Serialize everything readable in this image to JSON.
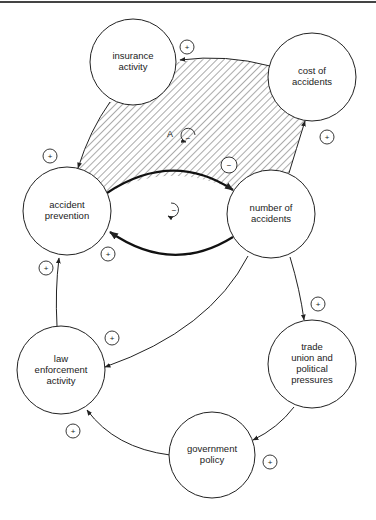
{
  "diagram": {
    "type": "causal-loop",
    "nodes": [
      {
        "id": "insurance",
        "lines": [
          "insurance",
          "activity"
        ]
      },
      {
        "id": "cost",
        "lines": [
          "cost of",
          "accidents"
        ]
      },
      {
        "id": "prevention",
        "lines": [
          "accident",
          "prevention"
        ]
      },
      {
        "id": "number",
        "lines": [
          "number of",
          "accidents"
        ]
      },
      {
        "id": "law",
        "lines": [
          "law",
          "enforcement",
          "activity"
        ]
      },
      {
        "id": "trade",
        "lines": [
          "trade",
          "union and",
          "political",
          "pressures"
        ]
      },
      {
        "id": "government",
        "lines": [
          "government",
          "policy"
        ]
      }
    ],
    "links": [
      {
        "from": "cost",
        "to": "insurance",
        "sign": "+"
      },
      {
        "from": "insurance",
        "to": "prevention",
        "sign": "+"
      },
      {
        "from": "prevention",
        "to": "number",
        "sign": "−"
      },
      {
        "from": "number",
        "to": "prevention",
        "sign": "+"
      },
      {
        "from": "number",
        "to": "cost",
        "sign": "+"
      },
      {
        "from": "law",
        "to": "prevention",
        "sign": "+"
      },
      {
        "from": "number",
        "to": "law",
        "sign": "+"
      },
      {
        "from": "number",
        "to": "trade",
        "sign": "+"
      },
      {
        "from": "trade",
        "to": "government",
        "sign": "+"
      },
      {
        "from": "government",
        "to": "law",
        "sign": "+"
      }
    ],
    "loops": [
      {
        "label": "A",
        "polarity": "−"
      },
      {
        "label": "",
        "polarity": "−"
      }
    ],
    "signs": {
      "plus": "+",
      "minus": "−"
    }
  }
}
